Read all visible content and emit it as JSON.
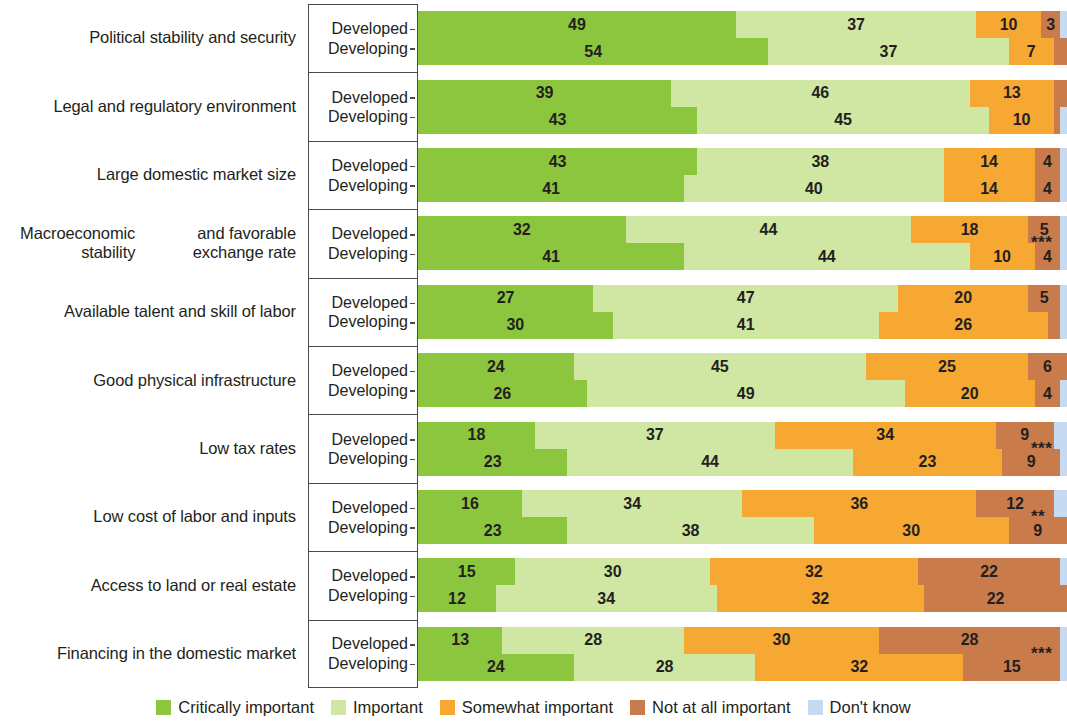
{
  "chart_data": {
    "type": "bar",
    "subtype": "stacked-horizontal-100",
    "title": "",
    "xlabel": "",
    "ylabel": "",
    "xlim": [
      0,
      100
    ],
    "grid": false,
    "legend_position": "bottom",
    "group_labels": [
      "Developed",
      "Developing"
    ],
    "series": [
      {
        "name": "Critically important",
        "color": "#8cc63e"
      },
      {
        "name": "Important",
        "color": "#cfe7a3"
      },
      {
        "name": "Somewhat important",
        "color": "#f7a833"
      },
      {
        "name": "Not at all important",
        "color": "#c97b4c"
      },
      {
        "name": "Don't know",
        "color": "#c6daf2"
      }
    ],
    "categories": [
      "Political stability and security",
      "Legal and regulatory environment",
      "Large domestic market size",
      "Macroeconomic stability and favorable exchange rate",
      "Available talent and skill of labor",
      "Good physical infrastructure",
      "Low tax rates",
      "Low cost of labor and inputs",
      "Access to land or real estate",
      "Financing in the domestic market"
    ],
    "rows": [
      {
        "category_lines": [
          "Political stability and security"
        ],
        "significance": "",
        "groups": [
          {
            "label": "Developed",
            "values": [
              49,
              37,
              10,
              3,
              1
            ]
          },
          {
            "label": "Developing",
            "values": [
              54,
              37,
              7,
              2,
              0
            ]
          }
        ]
      },
      {
        "category_lines": [
          "Legal and regulatory environment"
        ],
        "significance": "",
        "groups": [
          {
            "label": "Developed",
            "values": [
              39,
              46,
              13,
              2,
              0
            ]
          },
          {
            "label": "Developing",
            "values": [
              43,
              45,
              10,
              1,
              1
            ]
          }
        ]
      },
      {
        "category_lines": [
          "Large domestic market size"
        ],
        "significance": "",
        "groups": [
          {
            "label": "Developed",
            "values": [
              43,
              38,
              14,
              4,
              1
            ]
          },
          {
            "label": "Developing",
            "values": [
              41,
              40,
              14,
              4,
              1
            ]
          }
        ]
      },
      {
        "category_lines": [
          "Macroeconomic stability",
          "and favorable exchange rate"
        ],
        "significance": "***",
        "groups": [
          {
            "label": "Developed",
            "values": [
              32,
              44,
              18,
              5,
              1
            ]
          },
          {
            "label": "Developing",
            "values": [
              41,
              44,
              10,
              4,
              1
            ]
          }
        ]
      },
      {
        "category_lines": [
          "Available talent and skill of labor"
        ],
        "significance": "",
        "groups": [
          {
            "label": "Developed",
            "values": [
              27,
              47,
              20,
              5,
              1
            ]
          },
          {
            "label": "Developing",
            "values": [
              30,
              41,
              26,
              2,
              1
            ]
          }
        ]
      },
      {
        "category_lines": [
          "Good physical infrastructure"
        ],
        "significance": "",
        "groups": [
          {
            "label": "Developed",
            "values": [
              24,
              45,
              25,
              6,
              0
            ]
          },
          {
            "label": "Developing",
            "values": [
              26,
              49,
              20,
              4,
              1
            ]
          }
        ]
      },
      {
        "category_lines": [
          "Low tax rates"
        ],
        "significance": "***",
        "groups": [
          {
            "label": "Developed",
            "values": [
              18,
              37,
              34,
              9,
              2
            ]
          },
          {
            "label": "Developing",
            "values": [
              23,
              44,
              23,
              9,
              1
            ]
          }
        ]
      },
      {
        "category_lines": [
          "Low cost of labor and inputs"
        ],
        "significance": "**",
        "groups": [
          {
            "label": "Developed",
            "values": [
              16,
              34,
              36,
              12,
              2
            ]
          },
          {
            "label": "Developing",
            "values": [
              23,
              38,
              30,
              9,
              0
            ]
          }
        ]
      },
      {
        "category_lines": [
          "Access to land or real estate"
        ],
        "significance": "",
        "groups": [
          {
            "label": "Developed",
            "values": [
              15,
              30,
              32,
              22,
              1
            ]
          },
          {
            "label": "Developing",
            "values": [
              12,
              34,
              32,
              22,
              0
            ]
          }
        ]
      },
      {
        "category_lines": [
          "Financing in the domestic market"
        ],
        "significance": "***",
        "groups": [
          {
            "label": "Developed",
            "values": [
              13,
              28,
              30,
              28,
              1
            ]
          },
          {
            "label": "Developing",
            "values": [
              24,
              28,
              32,
              15,
              1
            ]
          }
        ]
      }
    ],
    "legend": [
      {
        "label": "Critically important",
        "color": "#8cc63e"
      },
      {
        "label": "Important",
        "color": "#cfe7a3"
      },
      {
        "label": "Somewhat important",
        "color": "#f7a833"
      },
      {
        "label": "Not at all important",
        "color": "#c97b4c"
      },
      {
        "label": "Don't know",
        "color": "#c6daf2"
      }
    ]
  }
}
